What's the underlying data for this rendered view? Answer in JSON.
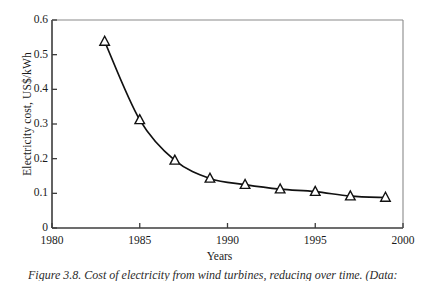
{
  "figure": {
    "caption": "Figure 3.8. Cost of electricity from wind turbines, reducing over time. (Data:",
    "caption_visible_note": "clipped at bottom edge"
  },
  "chart_data": {
    "type": "line",
    "title": "",
    "xlabel": "Years",
    "ylabel": "Electricity cost, US$/kWh",
    "xlim": [
      1980,
      2000
    ],
    "ylim": [
      0,
      0.6
    ],
    "xticks": [
      1980,
      1985,
      1990,
      1995,
      2000
    ],
    "xticklabels": [
      "1980",
      "1985",
      "1990",
      "1995",
      "2000"
    ],
    "yticks": [
      0,
      0.1,
      0.2,
      0.3,
      0.4,
      0.5,
      0.6
    ],
    "yticklabels": [
      "0",
      "0.1",
      "0.2",
      "0.3",
      "0.4",
      "0.5",
      "0.6"
    ],
    "grid": false,
    "legend": false,
    "marker": "triangle-up-open",
    "line_color": "#111111",
    "marker_edge_color": "#111111",
    "marker_face_color": "#ffffff",
    "x": [
      1983,
      1985,
      1987,
      1989,
      1991,
      1993,
      1995,
      1997,
      1999
    ],
    "values": [
      0.538,
      0.312,
      0.195,
      0.143,
      0.125,
      0.112,
      0.105,
      0.092,
      0.088
    ],
    "series": [
      {
        "name": "Electricity cost",
        "x": [
          1983,
          1985,
          1987,
          1989,
          1991,
          1993,
          1995,
          1997,
          1999
        ],
        "values": [
          0.538,
          0.312,
          0.195,
          0.143,
          0.125,
          0.112,
          0.105,
          0.092,
          0.088
        ]
      }
    ]
  }
}
